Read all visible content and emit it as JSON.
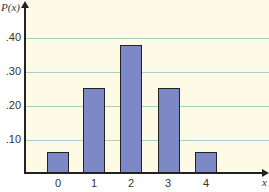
{
  "chart_data": {
    "type": "bar",
    "title": "",
    "xlabel": "x",
    "ylabel": "P(x)",
    "categories": [
      "0",
      "1",
      "2",
      "3",
      "4"
    ],
    "values": [
      0.0625,
      0.25,
      0.375,
      0.25,
      0.0625
    ],
    "ylim": [
      0,
      0.5
    ],
    "yticks": [
      ".10",
      ".20",
      ".30",
      ".40"
    ],
    "grid": true,
    "legend": null
  },
  "colors": {
    "background": "#fdfbe6",
    "bar_fill": "#7d88c6",
    "bar_edge": "#222222",
    "gridline": "#a8cfc8"
  }
}
